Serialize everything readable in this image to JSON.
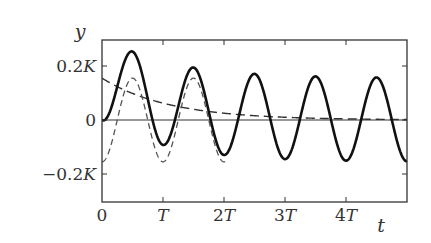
{
  "chart_data": {
    "type": "line",
    "title": "",
    "xlabel": "t",
    "ylabel": "y",
    "x_unit": "T",
    "xlim": [
      0,
      5
    ],
    "ylim": [
      -0.3,
      0.3
    ],
    "y_unit": "K",
    "grid": false,
    "legend": null,
    "xticks": [
      {
        "value": 0,
        "label": "0"
      },
      {
        "value": 1,
        "label": "T"
      },
      {
        "value": 2,
        "label": "2T"
      },
      {
        "value": 3,
        "label": "3T"
      },
      {
        "value": 4,
        "label": "4T"
      }
    ],
    "yticks": [
      {
        "value": 0.2,
        "label": "0.2K"
      },
      {
        "value": 0,
        "label": "0"
      },
      {
        "value": -0.2,
        "label": "−0.2K"
      }
    ],
    "zero_line": true,
    "series": [
      {
        "name": "total response",
        "style": "solid-thick",
        "description": "y = A(e^{-t/tau} - cos(2*pi*t/T)), A=0.155K, tau~1.1T",
        "x": [
          0,
          0.25,
          0.45,
          0.75,
          1.0,
          1.25,
          1.5,
          1.75,
          2.0,
          2.5,
          3.0,
          3.5,
          4.0,
          4.5,
          5.0
        ],
        "y": [
          0,
          0.12,
          0.255,
          0.07,
          -0.09,
          0.03,
          0.19,
          0.06,
          -0.13,
          0.17,
          -0.15,
          0.155,
          -0.155,
          0.155,
          -0.155
        ]
      },
      {
        "name": "forced oscillation",
        "style": "dashed",
        "description": "y = -A cos(2*pi*t/T), A=0.155K",
        "x": [
          0,
          0.25,
          0.5,
          0.75,
          1.0,
          1.5,
          2.0
        ],
        "y": [
          -0.155,
          0,
          0.155,
          0,
          -0.155,
          0.155,
          -0.155
        ]
      },
      {
        "name": "decaying transient",
        "style": "dashed",
        "description": "y = A e^{-t/tau}, A=0.155K, tau~1.1T",
        "x": [
          0,
          0.5,
          1.0,
          1.5,
          2.0,
          3.0,
          4.0,
          5.0
        ],
        "y": [
          0.155,
          0.098,
          0.06,
          0.04,
          0.025,
          0.01,
          0.004,
          0.001
        ]
      }
    ],
    "params": {
      "amplitude_K": 0.155,
      "tau_T": 1.1,
      "period_T": 1
    }
  },
  "axes": {
    "x_label": "t",
    "y_label": "y"
  }
}
